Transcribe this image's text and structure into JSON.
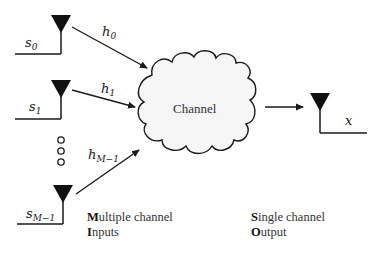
{
  "diagram": {
    "type": "MISO channel block diagram",
    "inputs": [
      {
        "signal": "s",
        "signal_sub": "0",
        "gain": "h",
        "gain_sub": "0"
      },
      {
        "signal": "s",
        "signal_sub": "1",
        "gain": "h",
        "gain_sub": "1"
      },
      {
        "signal": "s",
        "signal_sub": "M−1",
        "gain": "h",
        "gain_sub": "M−1"
      }
    ],
    "ellipsis": "○○○",
    "channel": {
      "label": "Channel"
    },
    "output": {
      "signal": "x"
    },
    "captions": {
      "inputs": {
        "line1_initial": "M",
        "line1_rest": "ultiple channel",
        "line2_initial": "I",
        "line2_rest": "nputs"
      },
      "output": {
        "line1_initial": "S",
        "line1_rest": "ingle channel",
        "line2_initial": "O",
        "line2_rest": "utput"
      }
    },
    "colors": {
      "stroke": "#1a1a1a",
      "cloud_fill": "#f6f6f6",
      "antenna_fill": "#111111"
    }
  }
}
